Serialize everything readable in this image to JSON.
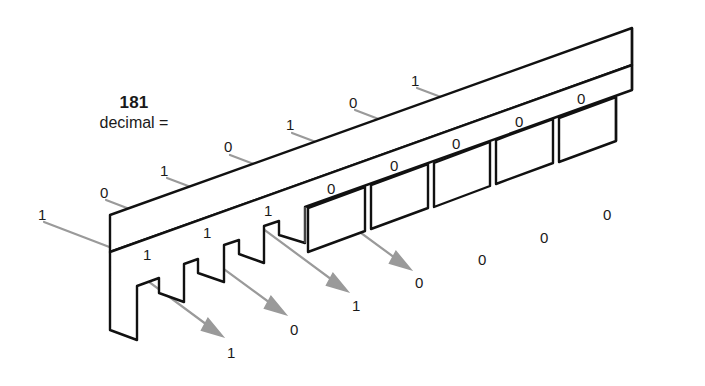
{
  "figure": {
    "title_number": "181",
    "title_sub": "decimal =",
    "binary_value": "10110101"
  },
  "colors": {
    "outline": "#111111",
    "leader": "#9a9a9a",
    "text": "#1a1a1a",
    "background": "#ffffff"
  },
  "leader_labels": [
    {
      "id": "lead-1",
      "value": "1",
      "x": 38,
      "y": 207
    },
    {
      "id": "lead-2",
      "value": "0",
      "x": 100,
      "y": 185
    },
    {
      "id": "lead-3",
      "value": "1",
      "x": 160,
      "y": 163
    },
    {
      "id": "lead-4",
      "value": "0",
      "x": 224,
      "y": 139
    },
    {
      "id": "lead-5",
      "value": "1",
      "x": 286,
      "y": 117
    },
    {
      "id": "lead-6",
      "value": "0",
      "x": 349,
      "y": 95
    },
    {
      "id": "lead-7",
      "value": "1",
      "x": 411,
      "y": 73
    }
  ],
  "face_labels": [
    {
      "id": "face-1",
      "value": "1",
      "x": 143,
      "y": 247
    },
    {
      "id": "face-2",
      "value": "1",
      "x": 203,
      "y": 225
    },
    {
      "id": "face-3",
      "value": "1",
      "x": 264,
      "y": 203
    },
    {
      "id": "face-4",
      "value": "0",
      "x": 327,
      "y": 181
    },
    {
      "id": "face-5",
      "value": "0",
      "x": 390,
      "y": 158
    },
    {
      "id": "face-6",
      "value": "0",
      "x": 452,
      "y": 136
    },
    {
      "id": "face-7",
      "value": "0",
      "x": 515,
      "y": 114
    },
    {
      "id": "face-8",
      "value": "0",
      "x": 577,
      "y": 91
    }
  ],
  "arrow_labels": [
    {
      "id": "arrow-1",
      "value": "1",
      "x": 227,
      "y": 345
    },
    {
      "id": "arrow-2",
      "value": "0",
      "x": 290,
      "y": 322
    },
    {
      "id": "arrow-3",
      "value": "1",
      "x": 352,
      "y": 298
    }
  ],
  "trailing_zeros": [
    {
      "id": "trail-1",
      "value": "0",
      "x": 415,
      "y": 275
    },
    {
      "id": "trail-2",
      "value": "0",
      "x": 478,
      "y": 252
    },
    {
      "id": "trail-3",
      "value": "0",
      "x": 540,
      "y": 230
    },
    {
      "id": "trail-4",
      "value": "0",
      "x": 603,
      "y": 207
    }
  ]
}
